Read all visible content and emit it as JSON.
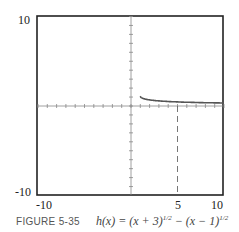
{
  "chart_data": {
    "type": "line",
    "title": "",
    "caption_label": "FIGURE 5-35",
    "caption_equation": "h(x) = (x + 3)^{1/2} − (x − 1)^{1/2}",
    "xlim": [
      -10,
      10
    ],
    "ylim": [
      -10,
      10
    ],
    "grid": false,
    "x_tick_labels": [
      "-10",
      "5",
      "10"
    ],
    "y_tick_labels": [
      "10",
      "-10"
    ],
    "series": [
      {
        "name": "h(x)",
        "x": [
          1,
          1.5,
          2,
          3,
          4,
          5,
          6,
          7,
          8,
          9,
          10
        ],
        "values": [
          2.0,
          1.16,
          0.92,
          1.04,
          0.91,
          0.83,
          0.76,
          0.71,
          0.67,
          0.63,
          0.61
        ]
      }
    ],
    "annotations": [
      {
        "type": "dashed-vertical-line",
        "x": 5,
        "from_y": 0,
        "to_y": -10
      }
    ]
  },
  "labels": {
    "y_top": "10",
    "y_bottom": "-10",
    "x_left": "-10",
    "x_mid": "5",
    "x_right": "10"
  },
  "caption": {
    "figure": "FIGURE 5-35",
    "equation": "h(x) = (x + 3)",
    "exp1": "1/2",
    "mid": " − (x − 1)",
    "exp2": "1/2"
  }
}
